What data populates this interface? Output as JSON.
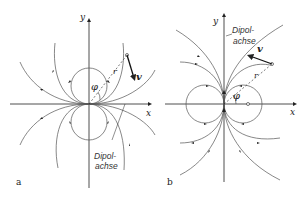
{
  "figure": {
    "panels": [
      {
        "id": "a",
        "panel_label": "a",
        "x_axis_label": "x",
        "y_axis_label": "y",
        "angle_label": "φ",
        "radius_label": "r",
        "vector_label": "v",
        "dipole_axis_label_line1": "Dipol-",
        "dipole_axis_label_line2": "achse",
        "dipole_orientation": "horizontal (along x-axis)"
      },
      {
        "id": "b",
        "panel_label": "b",
        "x_axis_label": "x",
        "y_axis_label": "y",
        "angle_label": "φ",
        "radius_label": "r",
        "vector_label": "v",
        "dipole_axis_label_line1": "Dipol-",
        "dipole_axis_label_line2": "achse",
        "dipole_orientation": "vertical (along y-axis)"
      }
    ]
  }
}
